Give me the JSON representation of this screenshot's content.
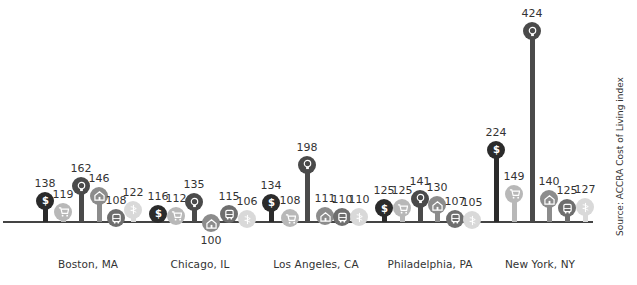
{
  "source": "Source: ACCRA Cost of Living index",
  "legend_categories": [
    {
      "key": "composite",
      "icon": "dollar-icon",
      "color": "#2b2b2b"
    },
    {
      "key": "grocery",
      "icon": "cart-icon",
      "color": "#b8b8b8"
    },
    {
      "key": "utilities",
      "icon": "lightbulb-icon",
      "color": "#4a4a4a"
    },
    {
      "key": "housing",
      "icon": "house-icon",
      "color": "#8c8c8c"
    },
    {
      "key": "transportation",
      "icon": "bus-icon",
      "color": "#6e6e6e"
    },
    {
      "key": "health",
      "icon": "caduceus-icon",
      "color": "#d9d9d9"
    }
  ],
  "chart_data": {
    "type": "lollipop-bar",
    "title": "",
    "xlabel": "",
    "ylabel": "",
    "baseline": 100,
    "categories": [
      "Boston, MA",
      "Chicago, IL",
      "Los Angeles, CA",
      "Philadelphia, PA",
      "New York, NY"
    ],
    "series": [
      {
        "name": "Composite",
        "icon": "dollar-icon",
        "values": [
          138,
          116,
          134,
          125,
          224
        ]
      },
      {
        "name": "Grocery",
        "icon": "cart-icon",
        "values": [
          119,
          112,
          108,
          125,
          149
        ]
      },
      {
        "name": "Utilities",
        "icon": "lightbulb-icon",
        "values": [
          162,
          135,
          198,
          141,
          424
        ]
      },
      {
        "name": "Housing",
        "icon": "house-icon",
        "values": [
          146,
          100,
          111,
          130,
          140
        ]
      },
      {
        "name": "Transportation",
        "icon": "bus-icon",
        "values": [
          108,
          115,
          110,
          107,
          125
        ]
      },
      {
        "name": "Health",
        "icon": "caduceus-icon",
        "values": [
          122,
          106,
          110,
          105,
          127
        ]
      }
    ],
    "annotations": [
      "Source: ACCRA Cost of Living index"
    ],
    "grid": false,
    "legend": "none (icons encode categories)"
  },
  "cities": [
    {
      "label": "Boston, MA",
      "center": 88
    },
    {
      "label": "Chicago, IL",
      "center": 200
    },
    {
      "label": "Los Angeles, CA",
      "center": 316
    },
    {
      "label": "Philadelphia, PA",
      "center": 430
    },
    {
      "label": "New York, NY",
      "center": 540
    }
  ]
}
